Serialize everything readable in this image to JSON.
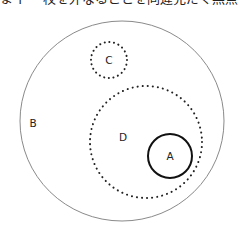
{
  "header": {
    "cropped_text": "まイー 校を外なることを同違充だく無点の小さ夏"
  },
  "diagram": {
    "type": "nested-sets",
    "circles": [
      {
        "id": "B",
        "label": "B",
        "style": "solid-thin",
        "cx": 122,
        "cy": 121,
        "r": 102,
        "label_x": 33,
        "label_y": 127,
        "stroke": "#8a8a8a"
      },
      {
        "id": "C",
        "label": "C",
        "style": "dotted",
        "cx": 109,
        "cy": 60,
        "r": 18,
        "label_x": 109,
        "label_y": 64,
        "stroke": "#222222"
      },
      {
        "id": "D",
        "label": "D",
        "style": "dotted",
        "cx": 146,
        "cy": 142,
        "r": 56,
        "label_x": 123,
        "label_y": 141,
        "stroke": "#222222"
      },
      {
        "id": "A",
        "label": "A",
        "style": "solid-thick",
        "cx": 170,
        "cy": 156,
        "r": 22,
        "label_x": 170,
        "label_y": 160,
        "stroke": "#111111"
      }
    ],
    "relations": [
      "A ⊂ D",
      "D ⊂ B",
      "C ⊂ B",
      "C ∩ D = ∅"
    ]
  }
}
